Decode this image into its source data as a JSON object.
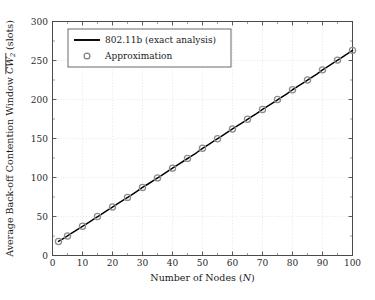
{
  "chart_data": {
    "type": "line",
    "title": "",
    "xlabel": "Number of Nodes (N)",
    "xlabel_main": "Number of Nodes (",
    "xlabel_var": "N",
    "xlabel_tail": ")",
    "ylabel": "Average Back-off Contention Window CW₂ (slots)",
    "ylabel_prefix": "Average Back-off Contention Window ",
    "ylabel_var": "CW",
    "ylabel_sub": "2",
    "ylabel_suffix": " (slots)",
    "xlim": [
      0,
      100
    ],
    "ylim": [
      0,
      300
    ],
    "xticks": [
      0,
      10,
      20,
      30,
      40,
      50,
      60,
      70,
      80,
      90,
      100
    ],
    "yticks": [
      0,
      50,
      100,
      150,
      200,
      250,
      300
    ],
    "xtick_labels": [
      "0",
      "10",
      "20",
      "30",
      "40",
      "50",
      "60",
      "70",
      "80",
      "90",
      "100"
    ],
    "ytick_labels": [
      "0",
      "50",
      "100",
      "150",
      "200",
      "250",
      "300"
    ],
    "grid": true,
    "grid_style": "dotted",
    "legend_position": "top-left",
    "legend": [
      {
        "label": "802.11b (exact analysis)",
        "marker": "line",
        "color": "#000000"
      },
      {
        "label": "Approximation",
        "marker": "circle",
        "color": "#808080"
      }
    ],
    "series": [
      {
        "name": "802.11b (exact analysis)",
        "type": "line",
        "color": "#000000",
        "x": [
          2,
          4,
          6,
          8,
          10,
          12,
          14,
          16,
          18,
          20,
          22,
          24,
          26,
          28,
          30,
          32,
          34,
          36,
          38,
          40,
          42,
          44,
          46,
          48,
          50,
          52,
          54,
          56,
          58,
          60,
          62,
          64,
          66,
          68,
          70,
          72,
          74,
          76,
          78,
          80,
          82,
          84,
          86,
          88,
          90,
          92,
          94,
          96,
          98,
          100
        ],
        "y": [
          18.0,
          22.6,
          27.6,
          32.5,
          37.4,
          42.3,
          47.3,
          52.2,
          57.1,
          62.1,
          67.0,
          71.9,
          76.9,
          81.8,
          87.2,
          92.0,
          96.9,
          101.8,
          106.8,
          112.0,
          116.9,
          121.8,
          126.8,
          131.7,
          137.4,
          142.3,
          147.2,
          152.2,
          157.1,
          162.2,
          167.1,
          172.0,
          177.0,
          181.9,
          187.3,
          192.2,
          197.1,
          202.1,
          207.0,
          212.5,
          217.4,
          222.3,
          227.3,
          232.2,
          238.0,
          242.9,
          247.8,
          252.8,
          257.7,
          263.0
        ]
      },
      {
        "name": "Approximation",
        "type": "scatter",
        "marker": "circle-open",
        "color": "#8c8c8c",
        "x": [
          2,
          5,
          10,
          15,
          20,
          25,
          30,
          35,
          40,
          45,
          50,
          55,
          60,
          65,
          70,
          75,
          80,
          85,
          90,
          95,
          100
        ],
        "y": [
          18.0,
          25.0,
          37.4,
          50.0,
          62.1,
          74.5,
          87.2,
          99.5,
          112.0,
          124.5,
          137.4,
          149.8,
          162.2,
          174.7,
          187.3,
          200.0,
          212.5,
          225.0,
          238.0,
          250.5,
          263.0
        ]
      }
    ]
  }
}
